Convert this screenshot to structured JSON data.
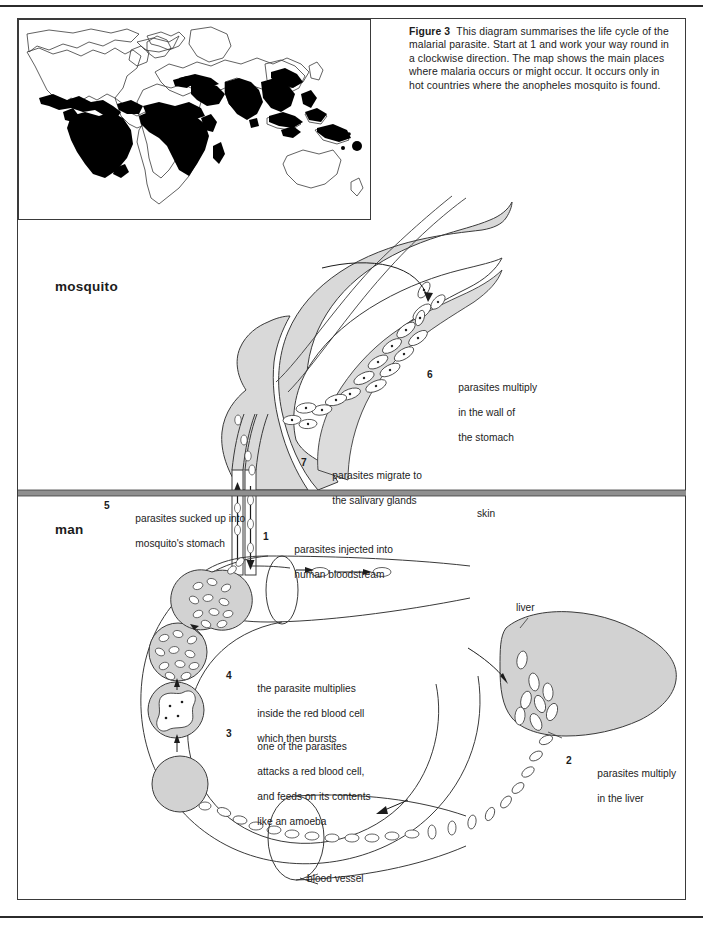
{
  "figure": {
    "label": "Figure 3",
    "caption": "This diagram summarises the life cycle of the malarial parasite. Start at 1 and work your way round in a clockwise direction. The map shows the main places where malaria occurs or might occur. It occurs only in hot countries where the anopheles mosquito is found."
  },
  "map": {
    "name": "world-malaria-distribution-map",
    "legend_fill": "#000000",
    "outline_color": "#3a3a3a"
  },
  "sections": {
    "mosquito": "mosquito",
    "man": "man",
    "skin": "skin"
  },
  "anatomy": {
    "liver": "liver",
    "blood_vessel": "blood vessel"
  },
  "steps": [
    {
      "number": "1",
      "lines": [
        "parasites injected into",
        "human bloodstream"
      ]
    },
    {
      "number": "2",
      "lines": [
        "parasites multiply",
        "in the liver"
      ]
    },
    {
      "number": "3",
      "lines": [
        "one of the parasites",
        "attacks a red blood cell,",
        "and feeds on its contents",
        "like an amoeba"
      ]
    },
    {
      "number": "4",
      "lines": [
        "the parasite multiplies",
        "inside the red blood cell",
        "which then bursts"
      ]
    },
    {
      "number": "5",
      "lines": [
        "parasites sucked up into",
        "mosquito's stomach"
      ]
    },
    {
      "number": "6",
      "lines": [
        "parasites multiply",
        "in the wall of",
        "the stomach"
      ]
    },
    {
      "number": "7",
      "lines": [
        "parasites migrate to",
        "the salivary glands"
      ]
    }
  ],
  "colors": {
    "ink": "#1c1c1c",
    "line": "#3a3a3a",
    "tissue_fill": "#d9d9d9",
    "cell_fill": "#d2d2d2",
    "skin_band": "#8f8f8f",
    "white": "#ffffff"
  }
}
